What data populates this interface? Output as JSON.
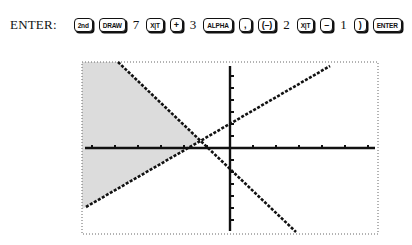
{
  "instruction": {
    "label": "ENTER:",
    "sequence": [
      {
        "type": "key",
        "text": "2nd",
        "name": "key-2nd",
        "size": "mid"
      },
      {
        "type": "key",
        "text": "DRAW",
        "name": "key-draw",
        "size": "wide"
      },
      {
        "type": "text",
        "text": "7"
      },
      {
        "type": "key",
        "text": "X|T",
        "name": "key-x-t",
        "size": "mid"
      },
      {
        "type": "key",
        "text": "+",
        "name": "key-plus",
        "size": "op"
      },
      {
        "type": "text",
        "text": "3"
      },
      {
        "type": "key",
        "text": "ALPHA",
        "name": "key-alpha",
        "size": "wide"
      },
      {
        "type": "key",
        "text": ",",
        "name": "key-comma",
        "size": "op"
      },
      {
        "type": "key",
        "text": "(–)",
        "name": "key-negative",
        "size": "op"
      },
      {
        "type": "text",
        "text": "2"
      },
      {
        "type": "key",
        "text": "X|T",
        "name": "key-x-t",
        "size": "mid"
      },
      {
        "type": "key",
        "text": "–",
        "name": "key-minus",
        "size": "op"
      },
      {
        "type": "text",
        "text": "1"
      },
      {
        "type": "key",
        "text": ")",
        "name": "key-close-paren",
        "size": "op"
      },
      {
        "type": "key",
        "text": "ENTER",
        "name": "key-enter",
        "size": "wide"
      }
    ]
  },
  "graph": {
    "frame": {
      "x1": 82,
      "y1": 62,
      "x2": 378,
      "y2": 234
    },
    "x_axis_y": 148,
    "y_axis_x": 230,
    "x_ticks_spacing": 23,
    "y_ticks_spacing": 12,
    "line_steep": {
      "x1": 118,
      "y1": 62,
      "x2": 296,
      "y2": 232
    },
    "line_shallow": {
      "x1": 86,
      "y1": 207,
      "x2": 330,
      "y2": 66
    },
    "shade_color": "#dcdcdc",
    "ink_color": "#111111"
  }
}
